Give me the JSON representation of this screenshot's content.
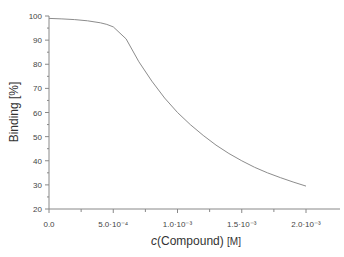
{
  "chart_data": {
    "type": "line",
    "title": "",
    "xlabel": "c(Compound) [M]",
    "xlabel_parts": {
      "italic": "c",
      "main": "(Compound) ",
      "unit": "[M]"
    },
    "ylabel": "Binding [%]",
    "xlim": [
      0,
      0.00214
    ],
    "ylim": [
      20,
      100
    ],
    "grid": false,
    "legend": null,
    "x_ticks": [
      {
        "value": 0,
        "label": "0.0"
      },
      {
        "value": 0.0005,
        "label": "5.0·10⁻⁴"
      },
      {
        "value": 0.001,
        "label": "1.0·10⁻³"
      },
      {
        "value": 0.0015,
        "label": "1.5·10⁻³"
      },
      {
        "value": 0.002,
        "label": "2.0·10⁻³"
      }
    ],
    "x_minor_ticks": [
      0.00025,
      0.00075,
      0.00125,
      0.00175
    ],
    "y_ticks": [
      100,
      90,
      80,
      70,
      60,
      50,
      40,
      30,
      20
    ],
    "series": [
      {
        "name": "Binding",
        "color": "#8c8c8c",
        "x": [
          0,
          0.0001,
          0.0002,
          0.0003,
          0.0004,
          0.00045,
          0.0005,
          0.0006,
          0.0007,
          0.0008,
          0.0009,
          0.001,
          0.0011,
          0.0012,
          0.0013,
          0.0014,
          0.0015,
          0.0016,
          0.0017,
          0.0018,
          0.0019,
          0.002
        ],
        "y": [
          99,
          98.8,
          98.5,
          98,
          97.2,
          96.5,
          95.5,
          90.5,
          81,
          73,
          66,
          60,
          55,
          50.5,
          46.5,
          43,
          40,
          37.3,
          35,
          33,
          31.2,
          29.5
        ]
      }
    ]
  },
  "colors": {
    "axis": "#888888",
    "line": "#8c8c8c",
    "text": "#444444"
  }
}
